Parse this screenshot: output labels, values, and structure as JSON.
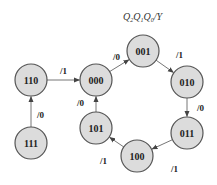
{
  "diagram": {
    "type": "state-transition",
    "title": "Q2Q1Q0/Y",
    "title_parts": {
      "q2": "Q",
      "s2": "2",
      "q1": "Q",
      "s1": "1",
      "q0": "Q",
      "s0": "0",
      "tail": "/Y"
    },
    "nodes": [
      {
        "id": "110",
        "label": "110",
        "cx": 31,
        "cy": 80
      },
      {
        "id": "000",
        "label": "000",
        "cx": 96,
        "cy": 80
      },
      {
        "id": "001",
        "label": "001",
        "cx": 143,
        "cy": 51
      },
      {
        "id": "010",
        "label": "010",
        "cx": 187,
        "cy": 82
      },
      {
        "id": "011",
        "label": "011",
        "cx": 187,
        "cy": 133
      },
      {
        "id": "100",
        "label": "100",
        "cx": 137,
        "cy": 156
      },
      {
        "id": "101",
        "label": "101",
        "cx": 96,
        "cy": 128
      },
      {
        "id": "111",
        "label": "111",
        "cx": 31,
        "cy": 143
      }
    ],
    "edges": [
      {
        "from": "110",
        "to": "000",
        "label": "/1"
      },
      {
        "from": "000",
        "to": "001",
        "label": "/0"
      },
      {
        "from": "001",
        "to": "010",
        "label": "/1"
      },
      {
        "from": "010",
        "to": "011",
        "label": "/0"
      },
      {
        "from": "011",
        "to": "100",
        "label": "/1"
      },
      {
        "from": "100",
        "to": "101",
        "label": "/1"
      },
      {
        "from": "101",
        "to": "000",
        "label": "/0"
      },
      {
        "from": "111",
        "to": "110",
        "label": "/0"
      }
    ],
    "colors": {
      "node_fill": "#dcdcdc",
      "node_stroke": "#555555",
      "edge": "#666666"
    }
  }
}
